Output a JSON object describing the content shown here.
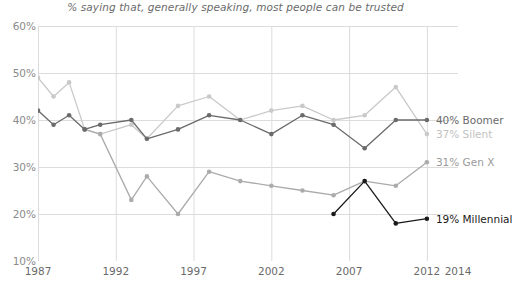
{
  "chart_data": {
    "type": "line",
    "title": "% saying that, generally speaking, most people can be trusted",
    "xlabel": "",
    "ylabel": "",
    "xlim": [
      1987,
      2014
    ],
    "ylim": [
      10,
      60
    ],
    "grid": true,
    "legend_position": "right-inline",
    "y_ticks": [
      "60%",
      "50%",
      "40%",
      "30%",
      "20%",
      "10%"
    ],
    "y_tick_values": [
      60,
      50,
      40,
      30,
      20,
      10
    ],
    "x_ticks": [
      "1987",
      "1992",
      "1997",
      "2002",
      "2007",
      "2012",
      "2014"
    ],
    "x_tick_values": [
      1987,
      1992,
      1997,
      2002,
      2007,
      2012,
      2014
    ],
    "series": [
      {
        "name": "Silent",
        "color": "#c9c9c9",
        "end_label": "37% Silent",
        "end_value": 37,
        "label_color": "#c2c2c2",
        "x": [
          1987,
          1988,
          1989,
          1990,
          1991,
          1993,
          1994,
          1996,
          1998,
          2000,
          2002,
          2004,
          2006,
          2008,
          2010,
          2012
        ],
        "y": [
          49,
          45,
          48,
          38,
          37,
          39,
          36,
          43,
          45,
          40,
          42,
          43,
          40,
          41,
          47,
          37
        ]
      },
      {
        "name": "Boomer",
        "color": "#6b6b6b",
        "end_label": "40% Boomer",
        "end_value": 40,
        "label_color": "#6b6b6b",
        "x": [
          1987,
          1988,
          1989,
          1990,
          1991,
          1993,
          1994,
          1996,
          1998,
          2000,
          2002,
          2004,
          2006,
          2008,
          2010,
          2012
        ],
        "y": [
          42,
          39,
          41,
          38,
          39,
          40,
          36,
          38,
          41,
          40,
          37,
          41,
          39,
          34,
          40,
          40
        ]
      },
      {
        "name": "Gen X",
        "color": "#ababab",
        "end_label": "31% Gen X",
        "end_value": 31,
        "label_color": "#9a9a9a",
        "x": [
          1990,
          1991,
          1993,
          1994,
          1996,
          1998,
          2000,
          2002,
          2004,
          2006,
          2008,
          2010,
          2012
        ],
        "y": [
          38,
          37,
          23,
          28,
          20,
          29,
          27,
          26,
          25,
          24,
          27,
          26,
          31
        ]
      },
      {
        "name": "Millennial",
        "color": "#1a1a1a",
        "end_label": "19% Millennial",
        "end_value": 19,
        "label_color": "#1a1a1a",
        "x": [
          2006,
          2008,
          2010,
          2012
        ],
        "y": [
          20,
          27,
          18,
          19
        ]
      }
    ]
  },
  "axis_colors": {
    "grid": "#dcdcdc",
    "baseline": "#6a6a6a",
    "tick_text": "#8a8a8a"
  }
}
